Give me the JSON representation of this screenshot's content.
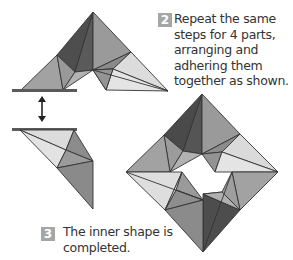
{
  "steps": [
    {
      "number": "2",
      "lines": [
        "Repeat the same",
        "steps for 4 parts,",
        "arranging and",
        "adhering them",
        "together as shown."
      ]
    },
    {
      "number": "3",
      "lines": [
        "The inner shape is",
        "completed."
      ]
    }
  ],
  "colors": {
    "dark": "#555555",
    "mid": "#8f8f8f",
    "light_mid": "#a9a9a9",
    "light": "#d6d6d6",
    "bar": "#5a5a5a",
    "badge": "#a6a6a6",
    "stroke": "#333333"
  },
  "figures": {
    "top_piece": "origami-part-top",
    "bottom_piece": "origami-part-bottom",
    "arrow": "double-arrow-vertical",
    "assembled": "origami-square-ring"
  }
}
